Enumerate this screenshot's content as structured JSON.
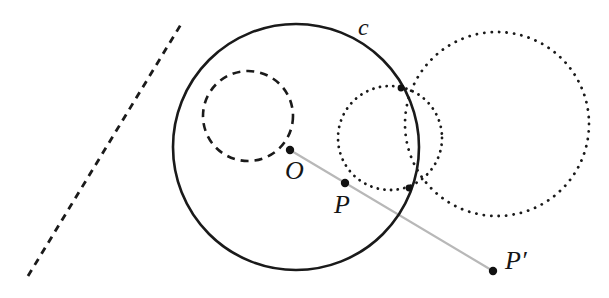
{
  "figure": {
    "background_color": "#ffffff",
    "width": 609,
    "height": 298,
    "labels": {
      "center": "O",
      "point": "P",
      "image_point": "P′",
      "circle": "c"
    },
    "colors": {
      "stroke": "#1a1a1a",
      "ray": "#b8b8b8",
      "dot": "#111111"
    }
  },
  "chart_data": {
    "type": "diagram",
    "coordinate_system": "pixels, origin top-left, 609 x 298",
    "circles": [
      {
        "name": "inversion-circle-c",
        "label": "c",
        "label_position": [
          365,
          30
        ],
        "cx": 296,
        "cy": 147,
        "r": 123,
        "style": "solid",
        "stroke_width": 2.6,
        "color": "#1a1a1a"
      },
      {
        "name": "dashed-circle-through-O",
        "label": "",
        "cx": 248,
        "cy": 116,
        "r": 45,
        "style": "dashed",
        "stroke_width": 2.6,
        "color": "#1a1a1a"
      },
      {
        "name": "small-dotted-circle",
        "label": "",
        "cx": 390,
        "cy": 138,
        "r": 52,
        "style": "dotted",
        "stroke_width": 2.8,
        "color": "#1a1a1a"
      },
      {
        "name": "large-dotted-circle",
        "label": "",
        "cx": 497,
        "cy": 124,
        "r": 92,
        "style": "dotted",
        "stroke_width": 2.8,
        "color": "#1a1a1a"
      }
    ],
    "lines": [
      {
        "name": "dashed-line",
        "x1": 28,
        "y1": 276,
        "x2": 183,
        "y2": 21,
        "style": "dashed",
        "stroke_width": 2.8,
        "color": "#1a1a1a"
      },
      {
        "name": "ray-O-to-Pprime",
        "x1": 290,
        "y1": 150,
        "x2": 493,
        "y2": 271,
        "style": "solid",
        "stroke_width": 2.2,
        "color": "#b8b8b8"
      }
    ],
    "points": [
      {
        "name": "O",
        "label": "O",
        "x": 290,
        "y": 150,
        "label_x": 295,
        "label_y": 178,
        "radius": 4.2
      },
      {
        "name": "P",
        "label": "P",
        "x": 345,
        "y": 183,
        "label_x": 344,
        "label_y": 212,
        "radius": 4.2
      },
      {
        "name": "P-prime",
        "label": "P′",
        "x": 493,
        "y": 271,
        "label_x": 515,
        "label_y": 268,
        "radius": 4.2
      },
      {
        "name": "intersection-upper",
        "label": "",
        "x": 401,
        "y": 88,
        "radius": 3.4
      },
      {
        "name": "intersection-lower",
        "label": "",
        "x": 409,
        "y": 188,
        "radius": 3.4
      }
    ]
  }
}
